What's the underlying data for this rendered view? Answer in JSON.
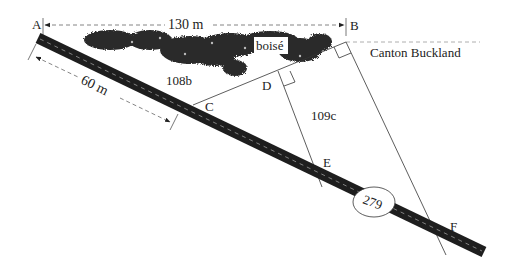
{
  "diagram": {
    "points": {
      "A": "A",
      "B": "B",
      "C": "C",
      "D": "D",
      "E": "E",
      "F": "F"
    },
    "dimensions": {
      "top_width": "130 m",
      "road_segment": "60 m"
    },
    "areas": {
      "forest_label": "boisé",
      "lot_left": "108b",
      "lot_right": "109c"
    },
    "boundary_label": "Canton Buckland",
    "road_number": "279",
    "colors": {
      "road": "#1e1e1e",
      "road_dashes": "#9a9a9a",
      "lines": "#333333",
      "forest": "#2a2a2a"
    }
  }
}
